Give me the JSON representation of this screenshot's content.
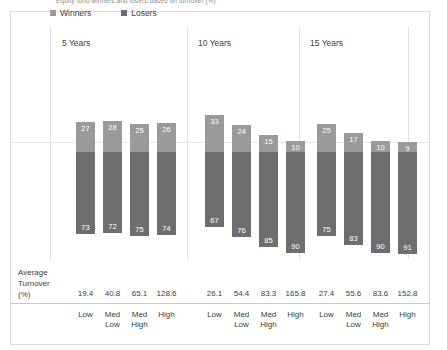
{
  "title": "Equity fund winners and losers based on turnover (%)",
  "legend": [
    {
      "label": "Winners",
      "color": "#9a9a9a",
      "icon": "square-swatch-icon"
    },
    {
      "label": "Losers",
      "color": "#6e6e6e",
      "icon": "square-swatch-icon"
    }
  ],
  "avg_turnover_label": "Average\nTurnover\n(%)",
  "avg_turnover_line1": "Average",
  "avg_turnover_line2": "Turnover",
  "avg_turnover_line3": "(%)",
  "groups": [
    {
      "name": "5 Years",
      "categories": [
        "Low",
        "Med Low",
        "Med High",
        "High"
      ],
      "winners": [
        27,
        28,
        25,
        26
      ],
      "losers": [
        73,
        72,
        75,
        74
      ],
      "turnover": [
        "19.4",
        "40.8",
        "65.1",
        "128.6"
      ]
    },
    {
      "name": "10 Years",
      "categories": [
        "Low",
        "Med Low",
        "Med High",
        "High"
      ],
      "winners": [
        33,
        24,
        15,
        10
      ],
      "losers": [
        67,
        76,
        85,
        90
      ],
      "turnover": [
        "26.1",
        "54.4",
        "83.3",
        "165.8"
      ]
    },
    {
      "name": "15 Years",
      "categories": [
        "Low",
        "Med Low",
        "Med High",
        "High"
      ],
      "winners": [
        25,
        17,
        10,
        9
      ],
      "losers": [
        75,
        83,
        90,
        91
      ],
      "turnover": [
        "27.4",
        "55.6",
        "83.6",
        "152.8"
      ]
    }
  ],
  "chart_data": {
    "type": "bar",
    "title": "Equity fund winners and losers based on turnover (%)",
    "subtype": "stacked-diverging-100pct",
    "xlabel": "",
    "ylabel": "Percent of funds (%)",
    "ylim": [
      -100,
      50
    ],
    "grid": false,
    "legend_position": "top-left",
    "panels": [
      "5 Years",
      "10 Years",
      "15 Years"
    ],
    "categories": [
      "Low",
      "Med Low",
      "Med High",
      "High"
    ],
    "series": [
      {
        "name": "Winners",
        "color": "#9a9a9a",
        "direction": "up",
        "values_by_panel": {
          "5 Years": [
            27,
            28,
            25,
            26
          ],
          "10 Years": [
            33,
            24,
            15,
            10
          ],
          "15 Years": [
            25,
            17,
            10,
            9
          ]
        }
      },
      {
        "name": "Losers",
        "color": "#6e6e6e",
        "direction": "down",
        "values_by_panel": {
          "5 Years": [
            73,
            72,
            75,
            74
          ],
          "10 Years": [
            67,
            76,
            85,
            90
          ],
          "15 Years": [
            75,
            83,
            90,
            91
          ]
        }
      }
    ],
    "annotations": {
      "row_label": "Average Turnover (%)",
      "values_by_panel": {
        "5 Years": [
          19.4,
          40.8,
          65.1,
          128.6
        ],
        "10 Years": [
          26.1,
          54.4,
          83.3,
          165.8
        ],
        "15 Years": [
          27.4,
          55.6,
          83.6,
          152.8
        ]
      }
    }
  }
}
